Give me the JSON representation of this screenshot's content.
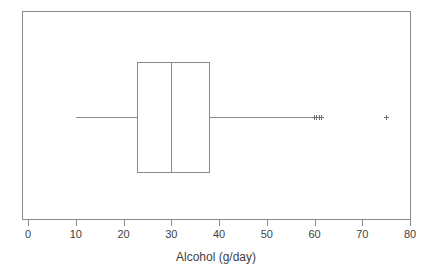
{
  "chart_data": {
    "type": "box",
    "title": "",
    "xlabel": "Alcohol (g/day)",
    "ylabel": "",
    "orientation": "horizontal",
    "xlim": [
      0,
      80
    ],
    "xticks": [
      0,
      10,
      20,
      30,
      40,
      50,
      60,
      70,
      80
    ],
    "xtick_labels": [
      "0",
      "10",
      "20",
      "30",
      "40",
      "50",
      "60",
      "70",
      "80"
    ],
    "grid": false,
    "legend": false,
    "box_stats": {
      "whisker_low": 10,
      "q1": 23,
      "median": 30,
      "q3": 38,
      "whisker_high": 60
    },
    "outliers": [
      60,
      60.5,
      61,
      61.5,
      75
    ],
    "series": [
      {
        "name": "Alcohol (g/day)",
        "whisker_low": 10,
        "q1": 23,
        "median": 30,
        "q3": 38,
        "whisker_high": 60,
        "outliers": [
          60,
          60.5,
          61,
          61.5,
          75
        ]
      }
    ]
  },
  "axis": {
    "x_title": "Alcohol (g/day)",
    "ticks": [
      {
        "value": 0,
        "label": "0"
      },
      {
        "value": 10,
        "label": "10"
      },
      {
        "value": 20,
        "label": "20"
      },
      {
        "value": 30,
        "label": "30"
      },
      {
        "value": 40,
        "label": "40"
      },
      {
        "value": 50,
        "label": "50"
      },
      {
        "value": 60,
        "label": "60"
      },
      {
        "value": 70,
        "label": "70"
      },
      {
        "value": 80,
        "label": "80"
      }
    ]
  },
  "colors": {
    "frame": "#8a8a8a",
    "box": "#8a8a8a",
    "median": "#8a8a8a",
    "whisker": "#8a8a8a",
    "outlier": "#6f6f6f",
    "text": "#3f3f3f",
    "background": "#ffffff"
  }
}
